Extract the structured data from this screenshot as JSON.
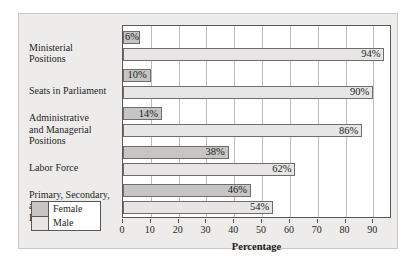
{
  "chart_data": {
    "type": "bar",
    "orientation": "horizontal",
    "title": "",
    "xlabel": "Percentage",
    "ylabel": "",
    "xlim": [
      0,
      96
    ],
    "xticks": [
      0,
      10,
      20,
      30,
      40,
      50,
      60,
      70,
      80,
      90
    ],
    "grid": "vertical",
    "legend_position": "bottom-left",
    "categories": [
      "Ministerial Positions",
      "Seats in Parliament",
      "Administrative and Managerial Positions",
      "Labor Force",
      "Primary, Secondary, and Tertiary Enrollment"
    ],
    "series": [
      {
        "name": "Female",
        "color": "#c6c5c3",
        "values": [
          6,
          10,
          14,
          38,
          46
        ],
        "labels": [
          "6%",
          "10%",
          "14%",
          "38%",
          "46%"
        ]
      },
      {
        "name": "Male",
        "color": "#e7e6e4",
        "values": [
          94,
          90,
          86,
          62,
          54
        ],
        "labels": [
          "94%",
          "90%",
          "86%",
          "62%",
          "54%"
        ]
      }
    ]
  },
  "category_lines": [
    [
      "Ministerial",
      "Positions"
    ],
    [
      "Seats in Parliament"
    ],
    [
      "Administrative",
      "and Managerial",
      "Positions"
    ],
    [
      "Labor Force"
    ],
    [
      "Primary, Secondary,",
      "and Tertiary",
      "Enrollment"
    ]
  ],
  "legend": {
    "female_label": "Female",
    "male_label": "Male"
  },
  "axis": {
    "title": "Percentage",
    "ticks": [
      "0",
      "10",
      "20",
      "30",
      "40",
      "50",
      "60",
      "70",
      "80",
      "90"
    ]
  }
}
